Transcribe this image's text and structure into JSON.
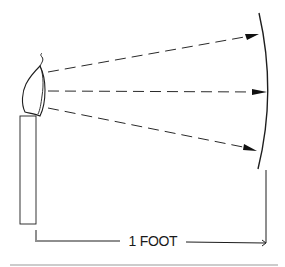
{
  "diagram": {
    "dimension_label": "1 FOOT",
    "elements": {
      "light_source": "candle",
      "rays": [
        "upper ray",
        "center ray",
        "lower ray"
      ],
      "target": "curved surface"
    },
    "colors": {
      "ink": "#1e1e1e",
      "rule": "#9a9a9a",
      "background": "#ffffff"
    }
  }
}
